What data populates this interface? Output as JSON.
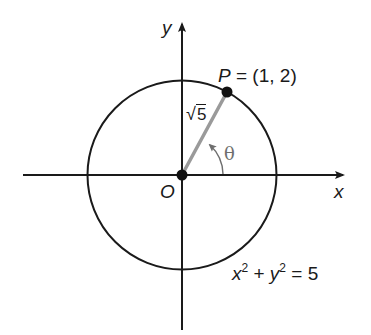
{
  "diagram": {
    "type": "unit-circle-style coordinate diagram",
    "colors": {
      "axis": "#1a1a1a",
      "circle": "#1a1a1a",
      "radius_segment": "#9a9a9a",
      "theta": "#6e6e6e",
      "text": "#1a1a1a"
    },
    "axes": {
      "x_label": "x",
      "y_label": "y",
      "origin_label": "O"
    },
    "circle": {
      "equation_lhs_x": "x",
      "equation_lhs_y": "y",
      "exponent": "2",
      "plus": "+",
      "equals": "=",
      "rhs": "5",
      "radius_squared": 5
    },
    "point": {
      "name": "P",
      "equals": "=",
      "coords_text": "(1, 2)",
      "x": 1,
      "y": 2
    },
    "radius_label": {
      "radical": "√",
      "radicand": "5"
    },
    "angle": {
      "label": "θ"
    }
  }
}
